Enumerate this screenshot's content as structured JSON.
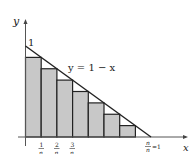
{
  "diagram": {
    "y_axis_label": "y",
    "x_axis_label": "x",
    "y_intercept_label": "1",
    "curve_label": "y = 1 − x",
    "tick_labels": [
      {
        "num": "1",
        "den": "n"
      },
      {
        "num": "2",
        "den": "n"
      },
      {
        "num": "3",
        "den": "n"
      }
    ],
    "end_label": {
      "num": "n",
      "den": "n",
      "suffix": "=1"
    },
    "n": 8,
    "bar_count": 7,
    "bar_heights": [
      0.875,
      0.75,
      0.625,
      0.5,
      0.375,
      0.25,
      0.125
    ],
    "colors": {
      "bar_fill": "#c8c8c8",
      "stroke": "#222222",
      "axis": "#555555"
    }
  }
}
